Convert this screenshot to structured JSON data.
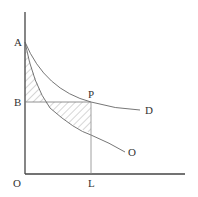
{
  "diagram": {
    "labels": {
      "A": "A",
      "B": "B",
      "P": "P",
      "D": "D",
      "O_curve": "O",
      "O_origin": "O",
      "L": "L"
    },
    "colors": {
      "axis": "#444444",
      "curve": "#666666",
      "guide": "#888888",
      "hatch": "#999999"
    }
  }
}
